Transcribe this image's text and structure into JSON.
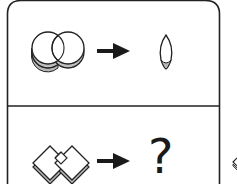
{
  "puzzle": {
    "row1": {
      "input_shape": "two-overlapping-circles-icon",
      "arrow": "right-arrow-icon",
      "output_shape": "lens-intersection-icon"
    },
    "row2": {
      "input_shape": "two-overlapping-diamonds-icon",
      "arrow": "right-arrow-icon",
      "output_label": "?"
    }
  },
  "colors": {
    "stroke": "#222222",
    "shade": "#b8b8b8",
    "background": "#ffffff"
  }
}
